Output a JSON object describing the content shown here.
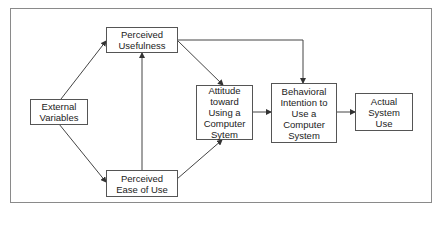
{
  "diagram": {
    "colors": {
      "line": "#444444",
      "box_border": "#555555",
      "text": "#222222",
      "frame": "#8a8a8a"
    },
    "nodes": {
      "external_variables": {
        "lines": [
          "External",
          "Variables"
        ]
      },
      "perceived_usefulness": {
        "lines": [
          "Perceived",
          "Usefulness"
        ]
      },
      "perceived_ease_of_use": {
        "lines": [
          "Perceived",
          "Ease of Use"
        ]
      },
      "attitude": {
        "lines": [
          "Attitude",
          "toward",
          "Using a",
          "Computer",
          "Sytem"
        ]
      },
      "behavioral_intention": {
        "lines": [
          "Behavioral",
          "Intention to",
          "Use a",
          "Computer",
          "System"
        ]
      },
      "actual_use": {
        "lines": [
          "Actual",
          "System",
          "Use"
        ]
      }
    },
    "edges": [
      {
        "from": "External Variables",
        "to": "Perceived Usefulness"
      },
      {
        "from": "External Variables",
        "to": "Perceived Ease of Use"
      },
      {
        "from": "Perceived Ease of Use",
        "to": "Perceived Usefulness"
      },
      {
        "from": "Perceived Usefulness",
        "to": "Attitude toward Using a Computer Sytem"
      },
      {
        "from": "Perceived Ease of Use",
        "to": "Attitude toward Using a Computer Sytem"
      },
      {
        "from": "Perceived Usefulness",
        "to": "Behavioral Intention to Use a Computer System"
      },
      {
        "from": "Attitude toward Using a Computer Sytem",
        "to": "Behavioral Intention to Use a Computer System"
      },
      {
        "from": "Behavioral Intention to Use a Computer System",
        "to": "Actual System Use"
      }
    ]
  }
}
